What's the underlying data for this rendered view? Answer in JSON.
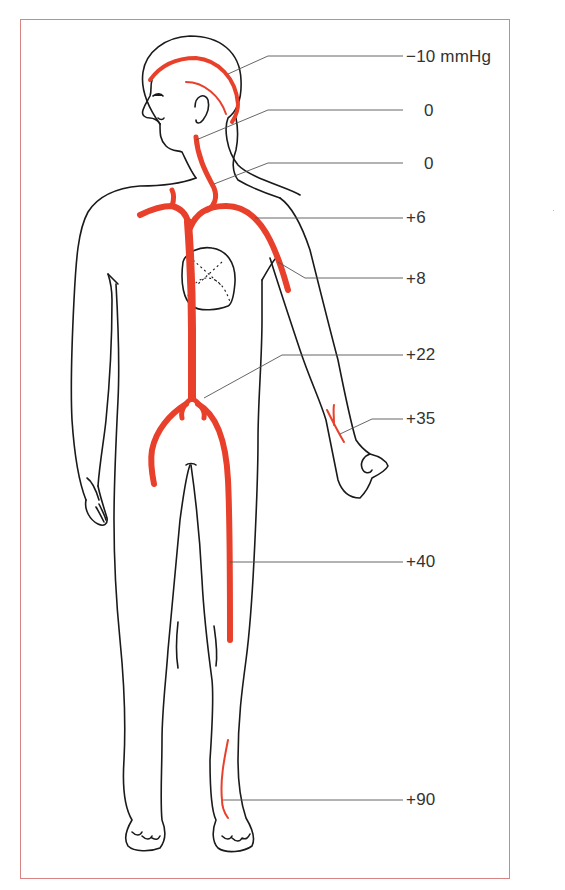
{
  "figure": {
    "unit": "mmHg",
    "colors": {
      "vessel": "#e8402a",
      "outline": "#1a1a1a",
      "leader": "#555555",
      "frame": "#d98484",
      "text": "#333333"
    }
  },
  "labels": [
    {
      "id": "scalp-veins",
      "text": "−10 mmHg",
      "value": -10
    },
    {
      "id": "jugular-upper",
      "text": "0",
      "value": 0
    },
    {
      "id": "jugular-lower",
      "text": "0",
      "value": 0
    },
    {
      "id": "subclavian",
      "text": "+6",
      "value": 6
    },
    {
      "id": "upper-arm",
      "text": "+8",
      "value": 8
    },
    {
      "id": "inferior-vena-cava",
      "text": "+22",
      "value": 22
    },
    {
      "id": "wrist",
      "text": "+35",
      "value": 35
    },
    {
      "id": "femoral-thigh",
      "text": "+40",
      "value": 40
    },
    {
      "id": "ankle",
      "text": "+90",
      "value": 90
    }
  ]
}
